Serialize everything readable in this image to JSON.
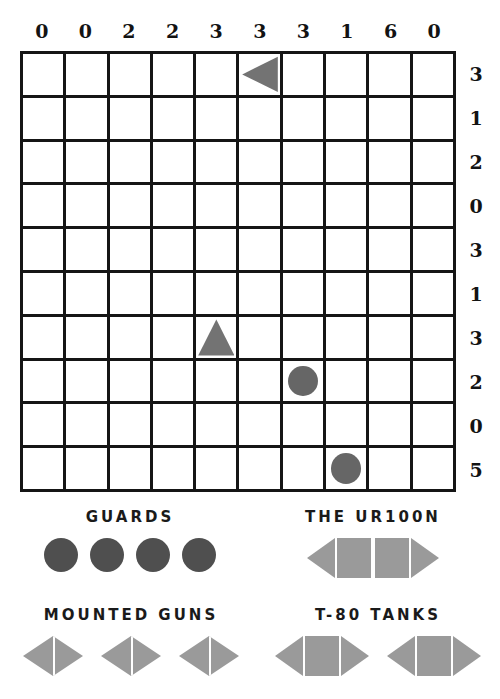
{
  "board": {
    "size": 10,
    "column_clues": [
      "0",
      "0",
      "2",
      "2",
      "3",
      "3",
      "3",
      "1",
      "6",
      "0"
    ],
    "row_clues": [
      "3",
      "1",
      "2",
      "0",
      "3",
      "1",
      "3",
      "2",
      "0",
      "5"
    ],
    "pieces": [
      {
        "row": 0,
        "col": 5,
        "shape": "triangle-left",
        "name": "ship-segment-triangle-left"
      },
      {
        "row": 6,
        "col": 4,
        "shape": "triangle-up",
        "name": "ship-segment-triangle-up"
      },
      {
        "row": 7,
        "col": 6,
        "shape": "circle",
        "name": "ship-submarine-circle"
      },
      {
        "row": 9,
        "col": 7,
        "shape": "circle",
        "name": "ship-submarine-circle"
      }
    ]
  },
  "colors": {
    "grid_line": "#151515",
    "board_piece": "#737373",
    "board_circle": "#666666",
    "legend_circle": "#4f4f4f",
    "legend_ship": "#9a9a9a",
    "background": "#ffffff"
  },
  "legend": {
    "guards": {
      "title": "GUARDS",
      "count": 4,
      "unit": "circle"
    },
    "ur100n": {
      "title": "THE UR100N",
      "count": 1,
      "unit": "ship-4-cell"
    },
    "mounted_guns": {
      "title": "MOUNTED GUNS",
      "count": 3,
      "unit": "ship-2-cell"
    },
    "t80_tanks": {
      "title": "T-80 TANKS",
      "count": 2,
      "unit": "ship-3-cell"
    }
  }
}
